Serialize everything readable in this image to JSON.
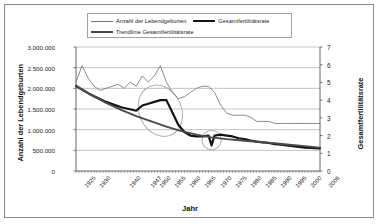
{
  "legend": {
    "items": [
      {
        "label": "Anzahl der Lebendgeburten",
        "style": "thin"
      },
      {
        "label": "Gesamtfertilitätsrate",
        "style": "thick"
      },
      {
        "label": "Trendlinie Gesamtfertilitätsrate",
        "style": "mid"
      }
    ]
  },
  "chart_data": {
    "type": "line",
    "title": "",
    "xlabel": "Jahr",
    "ylabel": "Anzahl der Lebendgeburten",
    "ylabel_right": "Gesamtfertilitätsrate",
    "grid": true,
    "legend_position": "top",
    "xlim": [
      1925,
      2006
    ],
    "ylim": [
      0,
      3000000
    ],
    "ylim_right": [
      0,
      7
    ],
    "ytick_labels_left": [
      "3.000.000",
      "2.500.000",
      "2.000.000",
      "1.500.000",
      "1.000.000",
      "500.000",
      "0"
    ],
    "ytick_values_left": [
      3000000,
      2500000,
      2000000,
      1500000,
      1000000,
      500000,
      0
    ],
    "ytick_labels_right": [
      "7",
      "6",
      "5",
      "4",
      "3",
      "2",
      "1",
      "0"
    ],
    "ytick_values_right": [
      7,
      6,
      5,
      4,
      3,
      2,
      1,
      0
    ],
    "xtick_labels": [
      "1925",
      "1930",
      "1940",
      "1947",
      "1950",
      "1955",
      "1960",
      "1965",
      "1970",
      "1975",
      "1980",
      "1985",
      "1990",
      "1995",
      "2000",
      "2006"
    ],
    "xtick_values": [
      1925,
      1930,
      1940,
      1947,
      1950,
      1955,
      1960,
      1965,
      1970,
      1975,
      1980,
      1985,
      1990,
      1995,
      2000,
      2006
    ],
    "series": [
      {
        "name": "Anzahl der Lebendgeburten",
        "axis": "left",
        "style": "thin",
        "color": "#6f6f6f",
        "x": [
          1925,
          1927,
          1929,
          1931,
          1933,
          1935,
          1937,
          1939,
          1941,
          1943,
          1945,
          1947,
          1949,
          1951,
          1953,
          1955,
          1957,
          1959,
          1961,
          1963,
          1965,
          1967,
          1969,
          1971,
          1973,
          1975,
          1977,
          1979,
          1981,
          1983,
          1985,
          1987,
          1989,
          1991,
          1993,
          1995,
          1997,
          1999,
          2001,
          2003,
          2006
        ],
        "y": [
          2150000,
          2550000,
          2250000,
          2050000,
          1950000,
          2000000,
          2050000,
          2100000,
          2000000,
          2150000,
          2050000,
          2300000,
          2150000,
          2300000,
          2550000,
          2150000,
          1900000,
          1750000,
          1800000,
          1900000,
          2000000,
          2050000,
          2050000,
          1900000,
          1600000,
          1400000,
          1350000,
          1350000,
          1350000,
          1300000,
          1200000,
          1200000,
          1200000,
          1150000,
          1150000,
          1150000,
          1150000,
          1150000,
          1150000,
          1150000,
          1150000
        ]
      },
      {
        "name": "Gesamtfertilitätsrate",
        "axis": "right",
        "style": "thick",
        "color": "#141414",
        "x": [
          1925,
          1930,
          1935,
          1940,
          1945,
          1947,
          1949,
          1951,
          1953,
          1955,
          1957,
          1959,
          1961,
          1963,
          1965,
          1967,
          1969,
          1970,
          1971,
          1973,
          1975,
          1977,
          1979,
          1981,
          1983,
          1985,
          1987,
          1989,
          1991,
          1993,
          1995,
          1997,
          1999,
          2001,
          2003,
          2006
        ],
        "y": [
          4.8,
          4.3,
          3.9,
          3.6,
          3.4,
          3.7,
          3.8,
          3.9,
          4.0,
          4.0,
          3.3,
          2.6,
          2.2,
          2.0,
          1.95,
          1.95,
          2.0,
          1.45,
          2.0,
          2.05,
          2.0,
          1.95,
          1.85,
          1.8,
          1.72,
          1.66,
          1.62,
          1.58,
          1.52,
          1.48,
          1.44,
          1.4,
          1.36,
          1.32,
          1.3,
          1.28
        ]
      },
      {
        "name": "Trendlinie Gesamtfertilitätsrate",
        "axis": "right",
        "style": "mid",
        "color": "#4a4a4a",
        "x": [
          1925,
          1930,
          1935,
          1940,
          1945,
          1950,
          1955,
          1960,
          1965,
          1970,
          1975,
          1980,
          1985,
          1990,
          1995,
          2000,
          2006
        ],
        "y": [
          4.8,
          4.3,
          3.85,
          3.45,
          3.1,
          2.8,
          2.5,
          2.25,
          2.05,
          1.9,
          1.8,
          1.72,
          1.65,
          1.58,
          1.5,
          1.42,
          1.32
        ]
      }
    ],
    "annotations": [
      {
        "type": "ellipse",
        "label": "highlight-babyboom",
        "cx": 1953,
        "cy_right": 3.4,
        "rx_years": 7,
        "ry_right": 1.5,
        "rotation": -25
      },
      {
        "type": "ellipse",
        "label": "highlight-pillenknick",
        "cx": 1970,
        "cy_right": 1.75,
        "rx_years": 3.2,
        "ry_right": 0.55,
        "rotation": 0
      }
    ]
  }
}
